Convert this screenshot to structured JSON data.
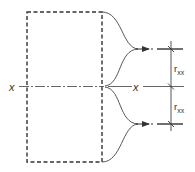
{
  "diagram": {
    "title": "",
    "colors": {
      "stroke": "#333333",
      "background": "#ffffff"
    },
    "labels": {
      "axis_left": "x",
      "axis_right": "x",
      "dim_upper_main": "r",
      "dim_upper_sub": "xx",
      "dim_lower_main": "r",
      "dim_lower_sub": "xx"
    },
    "elements": [
      {
        "type": "dashed-rectangle",
        "name": "cross-section-outline"
      },
      {
        "type": "dash-dot-line",
        "name": "x-axis"
      },
      {
        "type": "curved-arrow",
        "name": "upper-flow-arrow"
      },
      {
        "type": "curved-arrow",
        "name": "lower-flow-arrow"
      },
      {
        "type": "dimension-line",
        "name": "radius-of-gyration-dimension"
      }
    ]
  }
}
